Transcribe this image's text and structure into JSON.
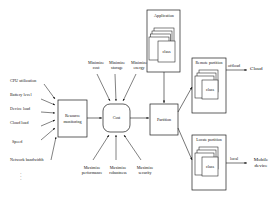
{
  "diagram": {
    "nodes": {
      "resource_monitoring": "Resource\nmonitoring",
      "cost": "Cost",
      "partition": "Partition",
      "application": "Application",
      "application_class": "class",
      "remote_partition": "Remote partition",
      "remote_class": "class",
      "local_partition": "Locate partition",
      "local_class": "class",
      "cloud": "Cloud",
      "mobile_device": "Mobile\ndevice"
    },
    "inputs": [
      "CPU utilization",
      "Battery level",
      "Device load",
      "Cloud load",
      "Speed",
      "Network bandwidth"
    ],
    "inputs_ellipsis": "·\n·\n·",
    "objectives_top": [
      {
        "line1": "Minimize",
        "line2": "cost"
      },
      {
        "line1": "Minimize",
        "line2": "storage"
      },
      {
        "line1": "Minimize",
        "line2": "energy"
      }
    ],
    "objectives_bottom": [
      {
        "line1": "Maximize",
        "line2": "performance"
      },
      {
        "line1": "Maximize",
        "line2": "robustness"
      },
      {
        "line1": "Maximize",
        "line2": "security"
      }
    ],
    "edge_labels": {
      "offload": "offload",
      "local": "local"
    },
    "colors": {
      "stroke": "#1a1a1a",
      "text": "#111111",
      "background": "#ffffff",
      "node_fill": "#ffffff"
    }
  }
}
